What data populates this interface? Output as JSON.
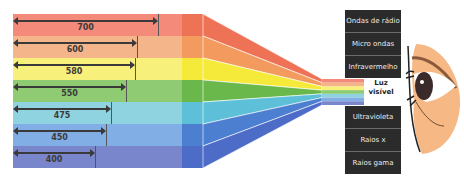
{
  "bands": [
    {
      "wavelength": "700",
      "color": "#f38a7a",
      "dark": "#ee7356",
      "bar_end": 158
    },
    {
      "wavelength": "600",
      "color": "#f5b58a",
      "dark": "#f39a5e",
      "bar_end": 137
    },
    {
      "wavelength": "580",
      "color": "#f7f07a",
      "dark": "#f5ea3a",
      "bar_end": 135
    },
    {
      "wavelength": "550",
      "color": "#8fcb73",
      "dark": "#6ab84b",
      "bar_end": 126
    },
    {
      "wavelength": "475",
      "color": "#8fd3e0",
      "dark": "#5ec0d8",
      "bar_end": 111
    },
    {
      "wavelength": "450",
      "color": "#82aee6",
      "dark": "#4d7fd0",
      "bar_end": 106
    },
    {
      "wavelength": "400",
      "color": "#7a86cc",
      "dark": "#4d6cc7",
      "bar_end": 95
    }
  ],
  "spectrum_top": [
    {
      "label": "Ondas de rádio"
    },
    {
      "label": "Micro ondas"
    },
    {
      "label": "Infravermelho"
    }
  ],
  "visible": {
    "line1": "Luz",
    "line2": "visível"
  },
  "spectrum_bottom": [
    {
      "label": "Ultravioleta"
    },
    {
      "label": "Raios x"
    },
    {
      "label": "Raios gama"
    }
  ],
  "colors": {
    "box_bg": "#2b2b2b",
    "box_text": "#eaeaea",
    "skin": "#f6b986",
    "iris": "#3a2a2a"
  }
}
